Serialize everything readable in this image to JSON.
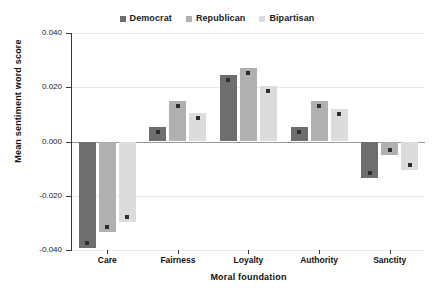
{
  "chart_data": {
    "type": "bar",
    "title": "",
    "xlabel": "Moral foundation",
    "ylabel": "Mean sentiment word score",
    "categories": [
      "Care",
      "Fairness",
      "Loyalty",
      "Authority",
      "Sanctity"
    ],
    "series": [
      {
        "name": "Democrat",
        "color": "#6e6e6e",
        "values": [
          -0.0394,
          0.0054,
          0.0246,
          0.0053,
          -0.0133
        ]
      },
      {
        "name": "Republican",
        "color": "#b0b0b0",
        "values": [
          -0.0335,
          0.0149,
          0.027,
          0.0149,
          -0.005
        ]
      },
      {
        "name": "Bipartisan",
        "color": "#dcdcdc",
        "values": [
          -0.0298,
          0.0104,
          0.0205,
          0.012,
          -0.0106
        ]
      }
    ],
    "ylim": [
      -0.04,
      0.04
    ],
    "yticks": [
      0.04,
      0.02,
      0.0,
      -0.02,
      -0.04
    ],
    "ytick_labels": [
      "0.040",
      "0.020",
      "0.000",
      "-0.020",
      "-0.040"
    ],
    "grid": true,
    "legend_position": "top-center",
    "marker_color": "#2e2e2e",
    "zero_line_color": "#9a9a9a",
    "axis_color": "#3a3a3a",
    "grid_color": "#e9e9e9",
    "background": "#ffffff"
  },
  "legend": {
    "entries": [
      {
        "label": "Democrat"
      },
      {
        "label": "Republican"
      },
      {
        "label": "Bipartisan"
      }
    ]
  },
  "axes": {
    "y_title": "Mean sentiment word score",
    "x_title": "Moral foundation",
    "y_tick_labels": [
      "0.040",
      "0.020",
      "0.000",
      "-0.020",
      "-0.040"
    ],
    "x_tick_labels": [
      "Care",
      "Fairness",
      "Loyalty",
      "Authority",
      "Sanctity"
    ]
  }
}
